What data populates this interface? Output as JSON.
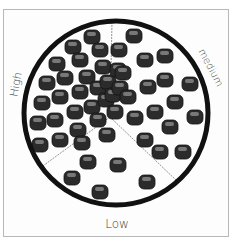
{
  "diagram": {
    "title": "",
    "circle": {
      "cx": 116,
      "cy": 113,
      "r": 92,
      "stroke": "#111111",
      "stroke_width": 5
    },
    "center": {
      "x": 110,
      "y": 117
    },
    "dividers": [
      {
        "to_x": 112,
        "to_y": 22
      },
      {
        "to_x": 40,
        "to_y": 168
      },
      {
        "to_x": 178,
        "to_y": 182
      }
    ],
    "regions": [
      {
        "name": "High",
        "label": "High",
        "density": "high",
        "particle_count": 28
      },
      {
        "name": "medium",
        "label": "medium",
        "density": "medium",
        "particle_count": 17
      },
      {
        "name": "Low",
        "label": "Low",
        "density": "low",
        "particle_count": 6
      }
    ],
    "particle_color": "#2b2b2b",
    "particle_highlight": "#9a9a9a",
    "particles": {
      "high": [
        [
          92,
          37
        ],
        [
          73,
          47
        ],
        [
          57,
          64
        ],
        [
          80,
          60
        ],
        [
          100,
          50
        ],
        [
          47,
          83
        ],
        [
          65,
          78
        ],
        [
          87,
          77
        ],
        [
          103,
          67
        ],
        [
          42,
          103
        ],
        [
          60,
          97
        ],
        [
          80,
          92
        ],
        [
          98,
          88
        ],
        [
          108,
          82
        ],
        [
          38,
          123
        ],
        [
          55,
          120
        ],
        [
          75,
          112
        ],
        [
          92,
          107
        ],
        [
          106,
          100
        ],
        [
          113,
          95
        ],
        [
          40,
          145
        ],
        [
          60,
          140
        ],
        [
          78,
          130
        ],
        [
          98,
          120
        ],
        [
          115,
          112
        ],
        [
          82,
          143
        ],
        [
          120,
          88
        ],
        [
          118,
          70
        ]
      ],
      "medium": [
        [
          134,
          36
        ],
        [
          119,
          50
        ],
        [
          145,
          60
        ],
        [
          165,
          56
        ],
        [
          123,
          73
        ],
        [
          148,
          87
        ],
        [
          165,
          80
        ],
        [
          190,
          84
        ],
        [
          128,
          97
        ],
        [
          175,
          102
        ],
        [
          155,
          112
        ],
        [
          195,
          117
        ],
        [
          135,
          118
        ],
        [
          170,
          127
        ],
        [
          145,
          140
        ],
        [
          160,
          152
        ],
        [
          183,
          152
        ]
      ],
      "low": [
        [
          107,
          135
        ],
        [
          88,
          162
        ],
        [
          118,
          165
        ],
        [
          72,
          178
        ],
        [
          100,
          192
        ],
        [
          147,
          182
        ]
      ]
    }
  },
  "labels": {
    "high": "High",
    "medium": "medium",
    "low": "Low"
  }
}
